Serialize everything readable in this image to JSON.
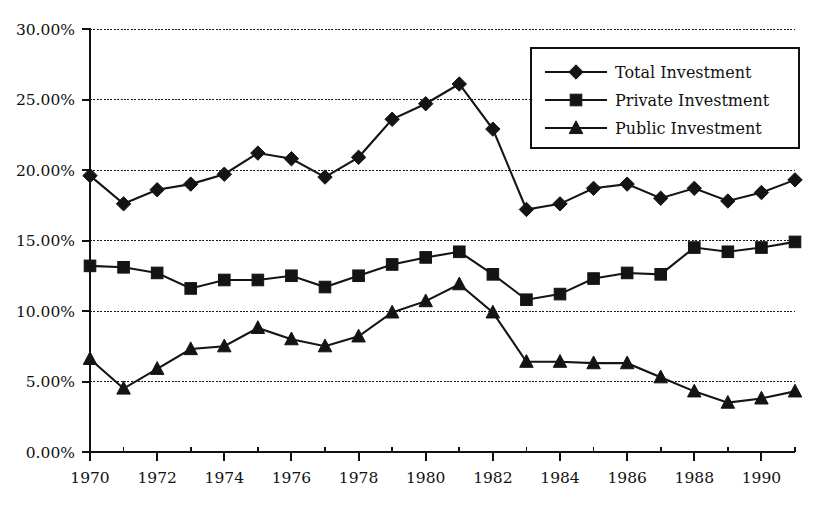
{
  "chart_data": {
    "type": "line",
    "title": "",
    "xlabel": "",
    "ylabel": "",
    "x": [
      1970,
      1971,
      1972,
      1973,
      1974,
      1975,
      1976,
      1977,
      1978,
      1979,
      1980,
      1981,
      1982,
      1983,
      1984,
      1985,
      1986,
      1987,
      1988,
      1989,
      1990,
      1991
    ],
    "categories": [
      "1970",
      "1971",
      "1972",
      "1973",
      "1974",
      "1975",
      "1976",
      "1977",
      "1978",
      "1979",
      "1980",
      "1981",
      "1982",
      "1983",
      "1984",
      "1985",
      "1986",
      "1987",
      "1988",
      "1989",
      "1990",
      "1991"
    ],
    "xlim": [
      1970,
      1991
    ],
    "ylim": [
      0,
      30
    ],
    "y_tick_values": [
      0,
      5,
      10,
      15,
      20,
      25,
      30
    ],
    "y_tick_labels": [
      "0.00%",
      "5.00%",
      "10.00%",
      "15.00%",
      "20.00%",
      "25.00%",
      "30.00%"
    ],
    "x_tick_labels": [
      "1970",
      "1972",
      "1974",
      "1976",
      "1978",
      "1980",
      "1982",
      "1984",
      "1986",
      "1988",
      "1990"
    ],
    "x_tick_values": [
      1970,
      1972,
      1974,
      1976,
      1978,
      1980,
      1982,
      1984,
      1986,
      1988,
      1990
    ],
    "x_minor_tick_values": [
      1971,
      1973,
      1975,
      1977,
      1979,
      1981,
      1983,
      1985,
      1987,
      1989,
      1991
    ],
    "grid": "horizontal",
    "legend_position": "top-right",
    "series": [
      {
        "name": "Total Investment",
        "marker": "diamond",
        "color": "#141414",
        "values": [
          19.6,
          17.6,
          18.6,
          19.0,
          19.7,
          21.2,
          20.8,
          19.5,
          20.9,
          23.6,
          24.7,
          26.1,
          22.9,
          17.2,
          17.6,
          18.7,
          19.0,
          18.0,
          18.7,
          17.8,
          18.4,
          19.3
        ]
      },
      {
        "name": "Private Investment",
        "marker": "square",
        "color": "#141414",
        "values": [
          13.2,
          13.1,
          12.7,
          11.6,
          12.2,
          12.2,
          12.5,
          11.7,
          12.5,
          13.3,
          13.8,
          14.2,
          12.6,
          10.8,
          11.2,
          12.3,
          12.7,
          12.6,
          14.5,
          14.2,
          14.5,
          14.9
        ]
      },
      {
        "name": "Public Investment",
        "marker": "triangle",
        "color": "#141414",
        "values": [
          6.6,
          4.5,
          5.9,
          7.3,
          7.5,
          8.8,
          8.0,
          7.5,
          8.2,
          9.9,
          10.7,
          11.9,
          9.9,
          6.4,
          6.4,
          6.3,
          6.3,
          5.3,
          4.3,
          3.5,
          3.8,
          4.3
        ]
      }
    ],
    "legend_entries": [
      "Total Investment",
      "Private Investment",
      "Public Investment"
    ]
  },
  "legend": {
    "items": [
      {
        "label": "Total Investment"
      },
      {
        "label": "Private Investment"
      },
      {
        "label": "Public Investment"
      }
    ]
  }
}
